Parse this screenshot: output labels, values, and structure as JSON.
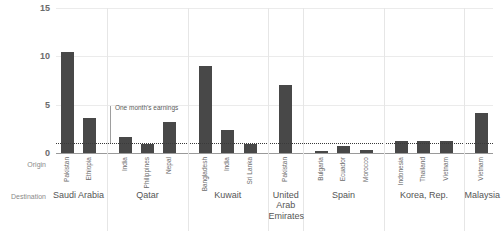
{
  "chart_data": {
    "type": "bar",
    "title": "",
    "xlabel": "",
    "ylabel": "",
    "ylim": [
      0,
      15
    ],
    "yticks": [
      0,
      5,
      10,
      15
    ],
    "ytick_labels": [
      "0",
      "5",
      "10",
      "15"
    ],
    "grid": true,
    "legend": "none",
    "reference_line": {
      "value": 1.0,
      "label": "One month's earnings",
      "style": "dotted"
    },
    "row_headers": {
      "origin": "Origin",
      "destination": "Destination"
    },
    "groups": [
      {
        "destination": "Saudi Arabia",
        "bars": [
          {
            "origin": "Pakistan",
            "value": 10.4
          },
          {
            "origin": "Ethiopia",
            "value": 3.6
          }
        ]
      },
      {
        "destination": "Qatar",
        "bars": [
          {
            "origin": "India",
            "value": 1.7
          },
          {
            "origin": "Philippines",
            "value": 0.9
          },
          {
            "origin": "Nepal",
            "value": 3.2
          }
        ]
      },
      {
        "destination": "Kuwait",
        "bars": [
          {
            "origin": "Bangladesh",
            "value": 9.0
          },
          {
            "origin": "India",
            "value": 2.4
          },
          {
            "origin": "Sri Lanka",
            "value": 0.9
          }
        ]
      },
      {
        "destination": "United Arab Emirates",
        "bars": [
          {
            "origin": "Pakistan",
            "value": 7.0
          }
        ]
      },
      {
        "destination": "Spain",
        "bars": [
          {
            "origin": "Bulgaria",
            "value": 0.25
          },
          {
            "origin": "Ecuador",
            "value": 0.7
          },
          {
            "origin": "Morocco",
            "value": 0.3
          }
        ]
      },
      {
        "destination": "Korea, Rep.",
        "bars": [
          {
            "origin": "Indonesia",
            "value": 1.2
          },
          {
            "origin": "Thailand",
            "value": 1.2
          },
          {
            "origin": "Vietnam",
            "value": 1.2
          }
        ]
      },
      {
        "destination": "Malaysia",
        "bars": [
          {
            "origin": "Vietnam",
            "value": 4.1
          }
        ]
      }
    ]
  },
  "style": {
    "bar_color": "#484848",
    "grid_color": "#ebebeb",
    "baseline_color": "#9a9a9a",
    "reference_color": "#3a3a3a",
    "text_color": "#6b6b6b",
    "background": "#ffffff"
  }
}
